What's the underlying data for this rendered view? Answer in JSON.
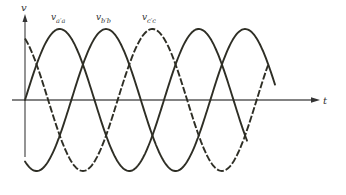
{
  "figure": {
    "y_axis_label": "v",
    "x_axis_label": "t",
    "curve_labels": {
      "a": {
        "main": "v",
        "sub": "a′a"
      },
      "b": {
        "main": "v",
        "sub": "b′b"
      },
      "c": {
        "main": "v",
        "sub": "c′c"
      }
    }
  },
  "chart_data": {
    "type": "line",
    "title": "",
    "xlabel": "t",
    "ylabel": "v",
    "grid": false,
    "legend": "inline labels above peaks",
    "amplitude": 1,
    "phase_shift_deg": 120,
    "series": [
      {
        "name": "v_a'a",
        "style": "solid",
        "phase_deg": 0,
        "x_end_cycles": 1.6
      },
      {
        "name": "v_b'b",
        "style": "solid",
        "phase_deg": -120,
        "x_end_cycles": 1.8
      },
      {
        "name": "v_c'c",
        "style": "dashed",
        "phase_deg": 120,
        "x_end_cycles": 1.75
      }
    ],
    "colors": {
      "curves": "#2e2e25",
      "axes": "#5a5a5a",
      "background": "#ffffff"
    }
  }
}
